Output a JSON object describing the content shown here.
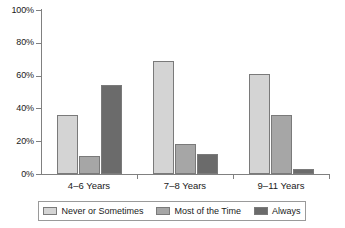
{
  "chart_data": {
    "type": "bar",
    "title": "",
    "xlabel": "",
    "ylabel": "",
    "ylim": [
      0,
      100
    ],
    "yticks": [
      "0%",
      "20%",
      "40%",
      "60%",
      "80%",
      "100%"
    ],
    "ytick_values": [
      0,
      20,
      40,
      60,
      80,
      100
    ],
    "grid": false,
    "legend_position": "bottom",
    "categories": [
      "4–6 Years",
      "7–8 Years",
      "9–11 Years"
    ],
    "series": [
      {
        "name": "Never or Sometimes",
        "color": "#d4d4d4",
        "values": [
          36,
          69,
          61
        ]
      },
      {
        "name": "Most of the Time",
        "color": "#a6a6a6",
        "values": [
          11,
          18,
          36
        ]
      },
      {
        "name": "Always",
        "color": "#6b6b6b",
        "values": [
          54,
          12,
          3
        ]
      }
    ]
  },
  "axis": {
    "y_labels": [
      "100%",
      "80%",
      "60%",
      "40%",
      "20%",
      "0%"
    ]
  },
  "legend": {
    "items": [
      {
        "label": "Never or Sometimes"
      },
      {
        "label": "Most of the Time"
      },
      {
        "label": "Always"
      }
    ]
  }
}
